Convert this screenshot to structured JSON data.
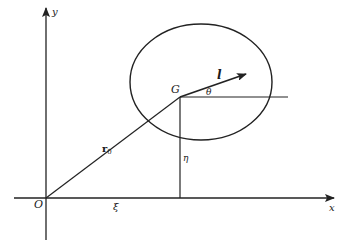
{
  "diagram": {
    "axes": {
      "x_label": "x",
      "y_label": "y",
      "origin_label": "O"
    },
    "points": {
      "center_of_mass_label": "G"
    },
    "vectors": {
      "position_vector_label": "r",
      "position_vector_subscript": "0",
      "orientation_vector_label": "l"
    },
    "coordinates": {
      "xi_label": "ξ",
      "eta_label": "η",
      "theta_label": "θ"
    },
    "colors": {
      "stroke": "#222222",
      "background": "#ffffff"
    }
  }
}
